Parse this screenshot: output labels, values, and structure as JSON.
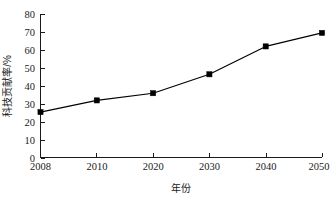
{
  "chart_data": {
    "type": "line",
    "title": "",
    "subtitle": "",
    "xlabel": "年份",
    "ylabel": "科技贡献率/%",
    "categories": [
      "2008",
      "2010",
      "2020",
      "2030",
      "2040",
      "2050"
    ],
    "x_tick_labels": [
      "2008",
      "2010",
      "2020",
      "2030",
      "2040",
      "2050"
    ],
    "y_tick_labels": [
      "0",
      "10",
      "20",
      "30",
      "40",
      "50",
      "60",
      "70",
      "80"
    ],
    "y_ticks": [
      0,
      10,
      20,
      30,
      40,
      50,
      60,
      70,
      80
    ],
    "ylim": [
      0,
      80
    ],
    "values": [
      25.5,
      32.0,
      36.0,
      46.5,
      62.0,
      69.5
    ],
    "series": [
      {
        "name": "科技贡献率",
        "values": [
          25.5,
          32.0,
          36.0,
          46.5,
          62.0,
          69.5
        ]
      }
    ],
    "marker": "square",
    "marker_color": "#000000",
    "line_color": "#000000",
    "grid": false,
    "legend": false,
    "legend_position": "none",
    "tick_direction": "in",
    "spines": [
      "left",
      "bottom"
    ],
    "background_color": "#ffffff",
    "annotations": []
  },
  "axes": {
    "y_axis_title": "科技贡献率/%",
    "x_axis_title": "年份"
  }
}
